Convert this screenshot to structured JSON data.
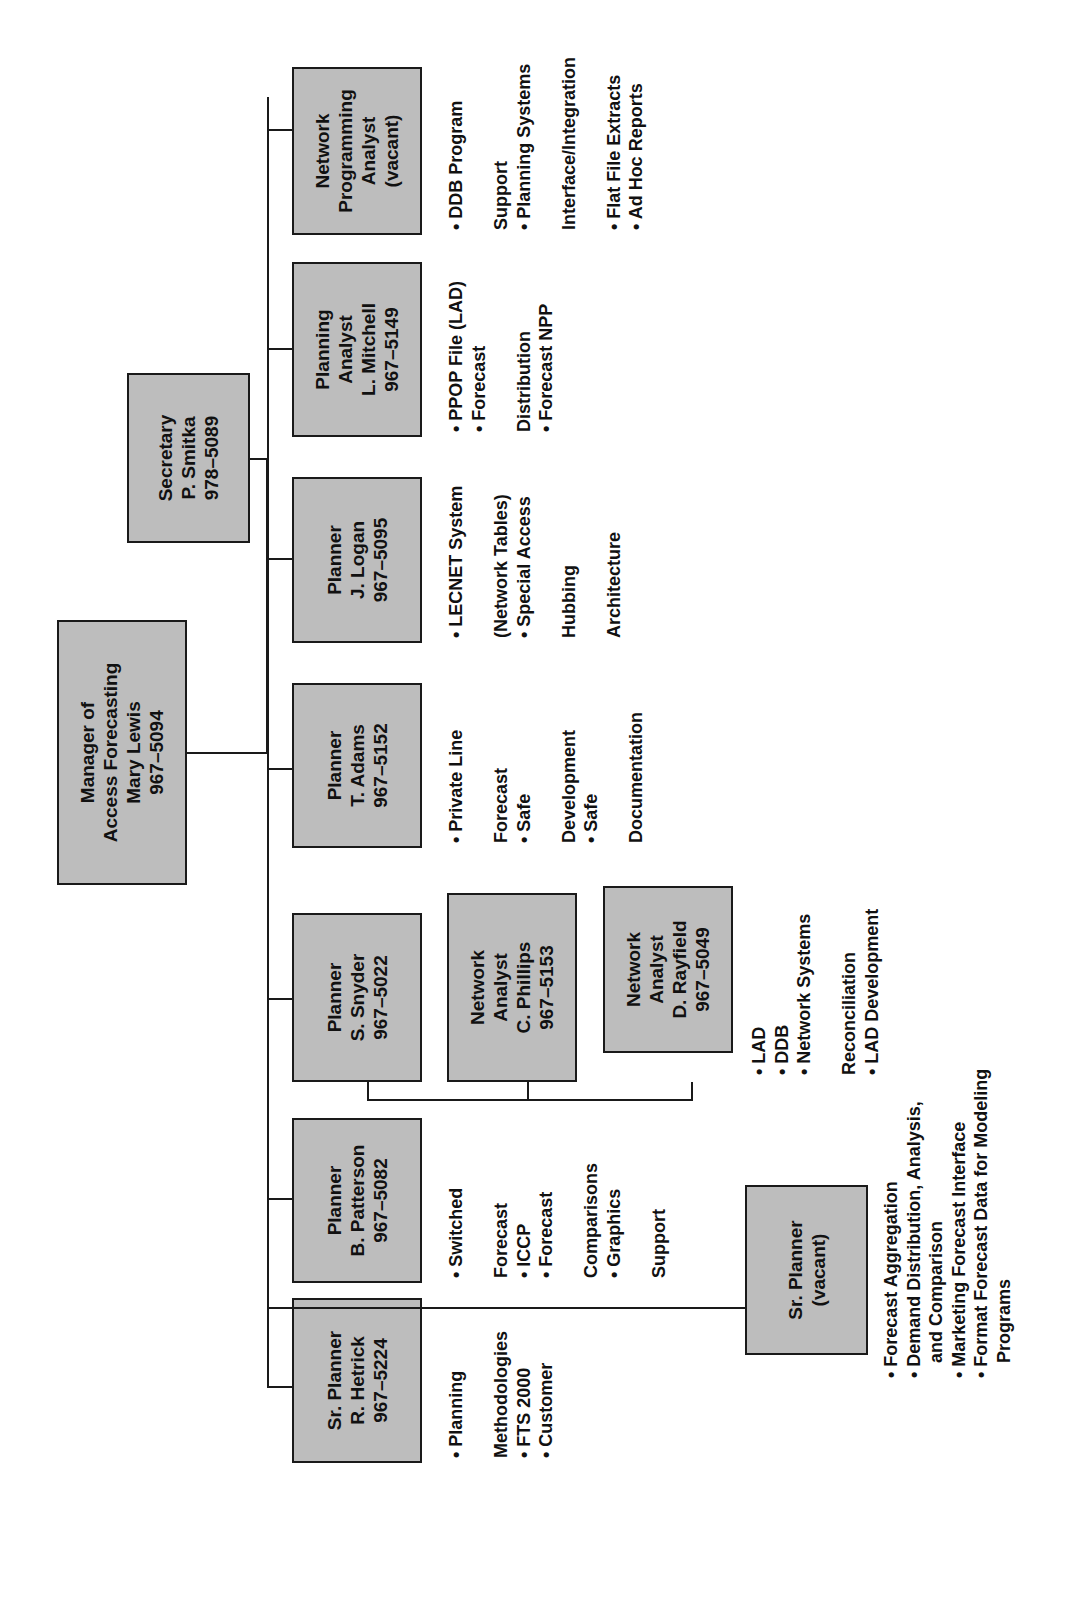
{
  "chart": {
    "manager": {
      "title_line1": "Manager of",
      "title_line2": "Access Forecasting",
      "name": "Mary Lewis",
      "phone": "967–5094"
    },
    "secretary": {
      "title": "Secretary",
      "name": "P. Smitka",
      "phone": "978–5089"
    },
    "positions": [
      {
        "title": "Sr. Planner",
        "name": "R. Hetrick",
        "phone": "967–5224",
        "duties": [
          "• Planning",
          "",
          "Methodologies",
          "• FTS 2000",
          "• Customer"
        ]
      },
      {
        "title": "Planner",
        "name": "B. Patterson",
        "phone": "967–5082",
        "duties": [
          "• Switched",
          "",
          "Forecast",
          "• ICCP",
          "• Forecast",
          "",
          "Comparisons",
          "• Graphics",
          "",
          "Support"
        ]
      },
      {
        "title": "Planner",
        "name": "S. Snyder",
        "phone": "967–5022",
        "duties": []
      },
      {
        "title": "Planner",
        "name": "T. Adams",
        "phone": "967–5152",
        "duties": [
          "• Private Line",
          "",
          "Forecast",
          "• Safe",
          "",
          "Development",
          "• Safe",
          "",
          "Documentation"
        ]
      },
      {
        "title": "Planner",
        "name": "J. Logan",
        "phone": "967–5095",
        "duties": [
          "• LECNET System",
          "",
          "(Network Tables)",
          "• Special Access",
          "",
          "Hubbing",
          "",
          "Architecture"
        ]
      },
      {
        "title_line1": "Planning",
        "title_line2": "Analyst",
        "name": "L. Mitchell",
        "phone": "967–5149",
        "duties": [
          "• PPOP File (LAD)",
          "• Forecast",
          "",
          "Distribution",
          "• Forecast NPP"
        ]
      },
      {
        "title_line1": "Network",
        "title_line2": "Programming",
        "title_line3": "Analyst",
        "name": "(vacant)",
        "duties": [
          "• DDB Program",
          "",
          "Support",
          "• Planning Systems",
          "",
          "Interface/Integration",
          "",
          "• Flat File Extracts",
          "• Ad Hoc Reports"
        ]
      }
    ],
    "network_analysts": [
      {
        "title_line1": "Network",
        "title_line2": "Analyst",
        "name": "C. Phillips",
        "phone": "967–5153"
      },
      {
        "title_line1": "Network",
        "title_line2": "Analyst",
        "name": "D. Rayfield",
        "phone": "967–5049"
      }
    ],
    "snyder_group_duties": [
      "• LAD",
      "• DDB",
      "• Network Systems",
      "",
      "Reconciliation",
      "• LAD Development"
    ],
    "sr_planner_vacant": {
      "title": "Sr. Planner",
      "name": "(vacant)",
      "duties": [
        "• Forecast Aggregation",
        "• Demand Distribution, Analysis,",
        "   and Comparison",
        "• Marketing Forecast Interface",
        "• Format Forecast Data for Modeling",
        "   Programs"
      ]
    }
  },
  "colors": {
    "box_fill": "#bdbdbd",
    "line": "#1a1a1a",
    "background": "#ffffff"
  }
}
